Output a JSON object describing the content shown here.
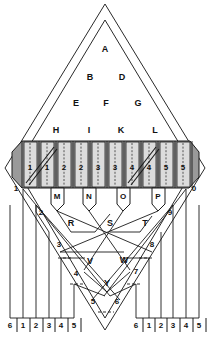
{
  "figure": {
    "type": "technical-line-diagram",
    "title": "",
    "outline": {
      "name": "double-diamond-outline",
      "outer": "5,168 105,4 205,168 105,330",
      "inner": "16,168 105,20 194,168 105,318"
    },
    "upper_nodes": [
      {
        "id": "A",
        "x": 105,
        "y": 50
      },
      {
        "id": "B",
        "x": 90,
        "y": 78
      },
      {
        "id": "D",
        "x": 122,
        "y": 78
      },
      {
        "id": "E",
        "x": 76,
        "y": 104
      },
      {
        "id": "F",
        "x": 106,
        "y": 104
      },
      {
        "id": "G",
        "x": 138,
        "y": 104
      }
    ],
    "band_nodes": [
      {
        "id": "H",
        "x": 56,
        "y": 131
      },
      {
        "id": "I",
        "x": 89,
        "y": 131
      },
      {
        "id": "K",
        "x": 121,
        "y": 131
      },
      {
        "id": "L",
        "x": 155,
        "y": 131
      }
    ],
    "band": {
      "name": "shaded-mechanism-band",
      "x": 12,
      "y": 140,
      "w": 187,
      "h": 48,
      "fill": "#9a9a9a",
      "cell_numbers": [
        "1",
        "1",
        "2",
        "2",
        "3",
        "3",
        "4",
        "4",
        "5",
        "5"
      ],
      "cell_centers_x": [
        30,
        47,
        64,
        81,
        98,
        115,
        132,
        149,
        166,
        183
      ],
      "diagonal_cells": [
        0,
        6
      ]
    },
    "band_edge_labels": [
      {
        "id": "1",
        "x": 16,
        "y": 189
      },
      {
        "id": "0",
        "x": 194,
        "y": 189
      }
    ],
    "tap_boxes": [
      {
        "id": "M",
        "x": 57,
        "y": 196
      },
      {
        "id": "N",
        "x": 89,
        "y": 196
      },
      {
        "id": "O",
        "x": 123,
        "y": 196
      },
      {
        "id": "P",
        "x": 158,
        "y": 196
      }
    ],
    "mid_nodes": [
      {
        "id": "R",
        "x": 71,
        "y": 224
      },
      {
        "id": "S",
        "x": 110,
        "y": 224
      },
      {
        "id": "T",
        "x": 145,
        "y": 224
      },
      {
        "id": "V",
        "x": 90,
        "y": 262
      },
      {
        "id": "W",
        "x": 124,
        "y": 261
      },
      {
        "id": "Y",
        "x": 107,
        "y": 284
      }
    ],
    "scale_numbers": [
      {
        "id": "2",
        "x": 41,
        "y": 213
      },
      {
        "id": "9",
        "x": 170,
        "y": 213
      },
      {
        "id": "3",
        "x": 59,
        "y": 245
      },
      {
        "id": "8",
        "x": 152,
        "y": 245
      },
      {
        "id": "4",
        "x": 76,
        "y": 274
      },
      {
        "id": "7",
        "x": 136,
        "y": 272
      },
      {
        "id": "5",
        "x": 93,
        "y": 302
      },
      {
        "id": "6",
        "x": 117,
        "y": 302
      }
    ],
    "terminal_row_left": {
      "labels": [
        "6",
        "1",
        "2",
        "3",
        "4",
        "5"
      ],
      "x": [
        10,
        23,
        36,
        49,
        61,
        74
      ],
      "y": 326
    },
    "terminal_row_right": {
      "labels": [
        "6",
        "1",
        "2",
        "3",
        "4",
        "5"
      ],
      "x": [
        136,
        149,
        161,
        173,
        186,
        199
      ],
      "y": 326
    },
    "colors": {
      "stroke": "#1a1a1a",
      "band_fill": "#9a9a9a",
      "cell_fill": "#d8d8d8",
      "background": "#ffffff"
    }
  }
}
